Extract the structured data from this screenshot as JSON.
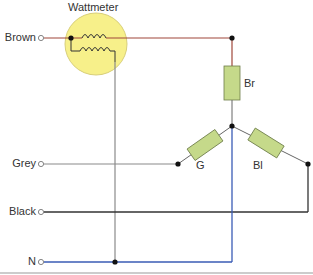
{
  "title": "Wattmeter",
  "terminals": [
    {
      "label": "Brown",
      "y": 38
    },
    {
      "label": "Grey",
      "y": 164
    },
    {
      "label": "Black",
      "y": 212
    },
    {
      "label": "N",
      "y": 262
    }
  ],
  "resistors": [
    {
      "label": "Br"
    },
    {
      "label": "G"
    },
    {
      "label": "Bl"
    }
  ],
  "colors": {
    "brown_wire": "#a0473a",
    "grey_wire": "#8a8a8a",
    "black_wire": "#333333",
    "neutral_wire": "#3a5bb5",
    "wattmeter_fill": "#f7f08a",
    "wattmeter_stroke": "#c8c06a",
    "resistor_fill": "#c5d98a",
    "resistor_stroke": "#6e7d4a"
  }
}
